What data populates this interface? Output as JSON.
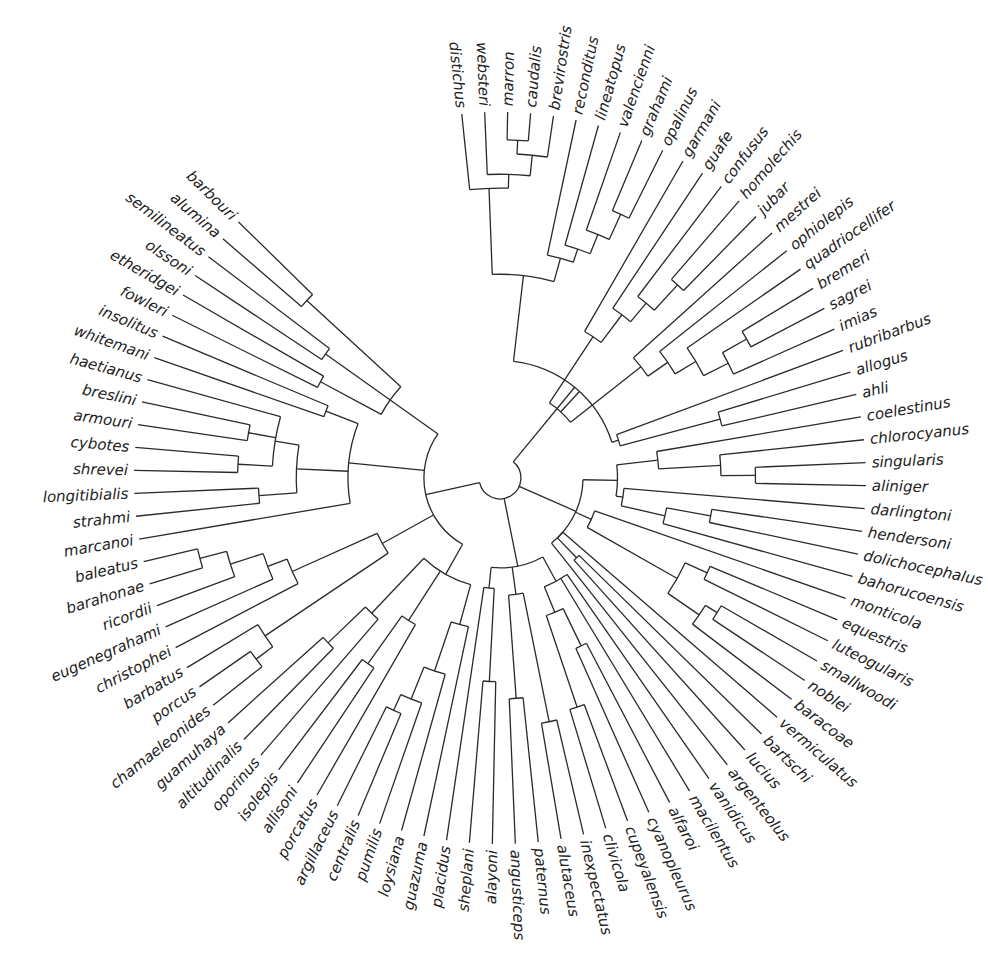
{
  "figure": {
    "type": "radial-phylogeny",
    "center": [
      500,
      478
    ],
    "label_radius": 378,
    "start_angle_deg": -96,
    "angle_step_deg": 3.6,
    "line_color": "#2a2a2a",
    "text_color": "#222222"
  },
  "taxa": [
    "distichus",
    "websteri",
    "marron",
    "caudalis",
    "brevirostris",
    "reconditus",
    "lineatopus",
    "valencienni",
    "grahami",
    "opalinus",
    "garmani",
    "guafe",
    "confusus",
    "homolechis",
    "jubar",
    "mestrei",
    "ophiolepis",
    "quadriocellifer",
    "bremeri",
    "sagrei",
    "imias",
    "rubribarbus",
    "allogus",
    "ahli",
    "coelestinus",
    "chlorocyanus",
    "singularis",
    "aliniger",
    "darlingtoni",
    "hendersoni",
    "dolichocephalus",
    "bahorucoensis",
    "monticola",
    "equestris",
    "luteogularis",
    "smallwoodi",
    "noblei",
    "baracoae",
    "vermiculatus",
    "bartschi",
    "lucius",
    "argenteolus",
    "vanidicus",
    "macilentus",
    "alfaroi",
    "cyanopleurus",
    "cupeyalensis",
    "clivicola",
    "inexpectatus",
    "alutaceus",
    "paternus",
    "angusticeps",
    "alayoni",
    "sheplani",
    "placidus",
    "guazuma",
    "loysiana",
    "pumilis",
    "centralis",
    "argillaceus",
    "porcatus",
    "allisoni",
    "isolepis",
    "oporinus",
    "altitudinalis",
    "guamuhaya",
    "chamaeleonides",
    "porcus",
    "barbatus",
    "christophei",
    "eugenegrahami",
    "ricordii",
    "barahonae",
    "baleatus",
    "marcanoi",
    "strahmi",
    "longitibialis",
    "shrevei",
    "cybotes",
    "armouri",
    "breslini",
    "haetianus",
    "whitemani",
    "insolitus",
    "fowleri",
    "etheridgei",
    "olssoni",
    "semilineatus",
    "alumina",
    "barbouri"
  ],
  "tree": {
    "d": 0.02,
    "c": [
      {
        "d": 0.3,
        "c": [
          {
            "d": 0.55,
            "c": [
              {
                "d": 0.8,
                "c": [
                  "distichus",
                  {
                    "d": 0.84,
                    "c": [
                      "websteri",
                      {
                        "d": 0.9,
                        "c": [
                          {
                            "d": 0.94,
                            "c": [
                              "marron",
                              "caudalis"
                            ]
                          },
                          "brevirostris"
                        ]
                      }
                    ]
                  }
                ]
              },
              {
                "d": 0.62,
                "c": [
                  "reconditus",
                  {
                    "d": 0.66,
                    "c": [
                      "lineatopus",
                      {
                        "d": 0.72,
                        "c": [
                          "valencienni",
                          {
                            "d": 0.8,
                            "c": [
                              "grahami",
                              "opalinus"
                            ]
                          }
                        ]
                      }
                    ]
                  }
                ]
              }
            ]
          },
          {
            "d": 0.22,
            "c": [
              {
                "d": 0.45,
                "c": [
                  "garmani",
                  {
                    "d": 0.55,
                    "c": [
                      "guafe",
                      {
                        "d": 0.62,
                        "c": [
                          "confusus",
                          {
                            "d": 0.72,
                            "c": [
                              "homolechis",
                              "jubar"
                            ]
                          }
                        ]
                      }
                    ]
                  }
                ]
              },
              {
                "d": 0.48,
                "c": [
                  "mestrei",
                  {
                    "d": 0.55,
                    "c": [
                      "ophiolepis",
                      {
                        "d": 0.62,
                        "c": [
                          "quadriocellifer",
                          {
                            "d": 0.7,
                            "c": [
                              {
                                "d": 0.78,
                                "c": [
                                  "bremeri",
                                  "sagrei"
                                ]
                              },
                              "imias"
                            ]
                          }
                        ]
                      }
                    ]
                  }
                ]
              }
            ]
          },
          {
            "d": 0.32,
            "c": [
              "rubribarbus",
              {
                "d": 0.62,
                "c": [
                  "allogus",
                  "ahli"
                ]
              }
            ]
          }
        ]
      },
      {
        "d": 0.2,
        "c": [
          {
            "d": 0.3,
            "c": [
              {
                "d": 0.42,
                "c": [
                  "coelestinus",
                  {
                    "d": 0.6,
                    "c": [
                      "chlorocyanus",
                      {
                        "d": 0.7,
                        "c": [
                          "singularis",
                          "aliniger"
                        ]
                      }
                    ]
                  }
                ]
              },
              {
                "d": 0.32,
                "c": [
                  "darlingtoni",
                  {
                    "d": 0.45,
                    "c": [
                      {
                        "d": 0.58,
                        "c": [
                          "hendersoni",
                          "dolichocephalus"
                        ]
                      },
                      "bahorucoensis"
                    ]
                  }
                ]
              }
            ]
          },
          {
            "d": 0.25,
            "c": [
              "monticola",
              {
                "d": 0.55,
                "c": [
                  {
                    "d": 0.62,
                    "c": [
                      "equestris",
                      "luteogularis"
                    ]
                  },
                  {
                    "d": 0.66,
                    "c": [
                      {
                        "d": 0.7,
                        "c": [
                          "smallwoodi",
                          "noblei"
                        ]
                      },
                      "baracoae"
                    ]
                  }
                ]
              }
            ]
          },
          {
            "d": 0.2,
            "c": [
              "vermiculatus",
              {
                "d": 0.28,
                "c": [
                  "bartschi",
                  "lucius"
                ]
              },
              "argenteolus"
            ]
          }
        ]
      },
      {
        "d": 0.22,
        "c": [
          {
            "d": 0.3,
            "c": [
              "vanidicus",
              "macilentus",
              {
                "d": 0.38,
                "c": [
                  {
                    "d": 0.5,
                    "c": [
                      "alfaroi",
                      "cyanopleurus"
                    ]
                  },
                  {
                    "d": 0.48,
                    "c": [
                      {
                        "d": 0.66,
                        "c": [
                          "cupeyalensis",
                          "clivicola"
                        ]
                      }
                    ]
                  }
                ]
              }
            ]
          },
          {
            "d": 0.3,
            "c": [
              {
                "d": 0.68,
                "c": [
                  "inexpectatus",
                  "alutaceus"
                ]
              },
              {
                "d": 0.5,
                "c": [
                  {
                    "d": 0.6,
                    "c": [
                      "paternus",
                      "angusticeps"
                    ]
                  }
                ]
              }
            ]
          },
          {
            "d": 0.28,
            "c": [
              {
                "d": 0.55,
                "c": [
                  "alayoni",
                  "sheplani"
                ]
              },
              "placidus"
            ]
          }
        ]
      },
      {
        "d": 0.18,
        "c": [
          {
            "d": 0.28,
            "c": [
              {
                "d": 0.4,
                "c": [
                  "guazuma",
                  {
                    "d": 0.55,
                    "c": [
                      "loysiana",
                      {
                        "d": 0.65,
                        "c": [
                          "pumilis",
                          {
                            "d": 0.7,
                            "c": [
                              "centralis",
                              "argillaceus"
                            ]
                          }
                        ]
                      }
                    ]
                  }
                ]
              },
              {
                "d": 0.45,
                "c": [
                  "porcatus",
                  {
                    "d": 0.62,
                    "c": [
                      "allisoni",
                      "isolepis"
                    ]
                  }
                ]
              },
              {
                "d": 0.5,
                "c": [
                  "oporinus",
                  {
                    "d": 0.65,
                    "c": [
                      "altitudinalis",
                      "guamuhaya"
                    ]
                  }
                ]
              }
            ]
          },
          {
            "d": 0.35,
            "c": [
              {
                "d": 0.78,
                "c": [
                  {
                    "d": 0.84,
                    "c": [
                      "chamaeleonides",
                      "porcus"
                    ]
                  },
                  "barbatus"
                ]
              },
              {
                "d": 0.62,
                "c": [
                  "christophei",
                  {
                    "d": 0.68,
                    "c": [
                      "eugenegrahami",
                      {
                        "d": 0.78,
                        "c": [
                          "ricordii",
                          {
                            "d": 0.86,
                            "c": [
                              "barahonae",
                              "baleatus"
                            ]
                          }
                        ]
                      }
                    ]
                  }
                ]
              }
            ]
          },
          {
            "d": 0.4,
            "c": [
              "marcanoi",
              {
                "d": 0.55,
                "c": [
                  {
                    "d": 0.66,
                    "c": [
                      "strahmi",
                      "longitibialis"
                    ]
                  },
                  {
                    "d": 0.62,
                    "c": [
                      {
                        "d": 0.72,
                        "c": [
                          "shrevei",
                          "cybotes"
                        ]
                      },
                      {
                        "d": 0.7,
                        "c": [
                          "armouri",
                          "breslini"
                        ]
                      },
                      "haetianus"
                    ]
                  }
                ]
              },
              {
                "d": 0.5,
                "c": [
                  "whitemani",
                  "insolitus"
                ]
              }
            ]
          },
          {
            "d": 0.35,
            "c": [
              {
                "d": 0.55,
                "c": [
                  "fowleri",
                  "etheridgei"
                ]
              },
              {
                "d": 0.58,
                "c": [
                  "olssoni",
                  "semilineatus"
                ]
              },
              {
                "d": 0.72,
                "c": [
                  "alumina",
                  "barbouri"
                ]
              }
            ]
          }
        ]
      }
    ]
  }
}
